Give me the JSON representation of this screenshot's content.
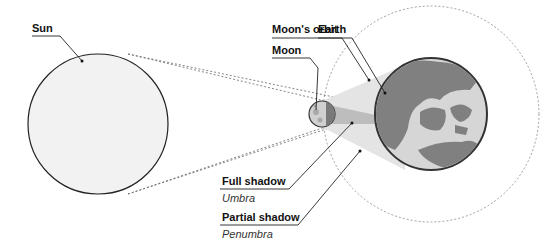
{
  "diagram": {
    "labels": {
      "sun": "Sun",
      "moons_orbit": "Moon's orbit",
      "moon": "Moon",
      "earth": "Earth",
      "full_shadow": "Full shadow",
      "umbra": "Umbra",
      "partial_shadow": "Partial shadow",
      "penumbra": "Penumbra"
    },
    "colors": {
      "sun_fill": "#f2f2f2",
      "earth_ocean": "#d6d6d6",
      "earth_land": "#808080",
      "umbra": "#bdbdbd",
      "penumbra": "#e4e4e4",
      "outline": "#333333"
    }
  }
}
